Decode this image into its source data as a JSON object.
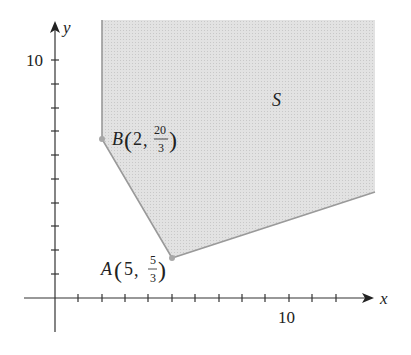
{
  "diagram": {
    "type": "feasible-region",
    "region_label": "S",
    "axes": {
      "x_label": "x",
      "y_label": "y",
      "x_tick_label": "10",
      "y_tick_label": "10",
      "x_ticks": 13,
      "y_ticks": 10
    },
    "points": [
      {
        "name": "B",
        "label": "B",
        "x": "2",
        "y_num": "20",
        "y_den": "3"
      },
      {
        "name": "A",
        "label": "A",
        "x": "5",
        "y_num": "5",
        "y_den": "3"
      }
    ],
    "colors": {
      "region_fill": "#d9d9d9",
      "region_edge": "#9a9a9a",
      "axis": "#333333",
      "point": "#a8a8a8"
    }
  }
}
